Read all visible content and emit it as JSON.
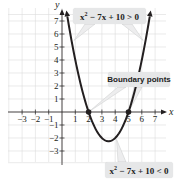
{
  "chart_data": {
    "type": "line",
    "title": "",
    "function": "x^2 - 7x + 10",
    "xlabel": "x",
    "ylabel": "y",
    "xlim": [
      -3.9,
      7.6
    ],
    "ylim": [
      -3.9,
      8
    ],
    "x_ticks": [
      -3,
      -2,
      -1,
      1,
      2,
      3,
      4,
      5,
      6,
      7
    ],
    "y_ticks": [
      7,
      6,
      5,
      4,
      3,
      2,
      1,
      -1,
      -2,
      -3
    ],
    "x_tick_labels": [
      "−3",
      "−2",
      "−1",
      "1",
      "2",
      "3",
      "4",
      "5",
      "6",
      "7"
    ],
    "y_tick_labels": [
      "7",
      "6",
      "5",
      "4",
      "3",
      "2",
      "1",
      "−1",
      "−2",
      "−3"
    ],
    "grid": true,
    "series": [
      {
        "name": "y = x^2 - 7x + 10",
        "x": [
          0.35,
          1,
          1.5,
          2,
          2.5,
          3,
          3.5,
          4,
          4.5,
          5,
          5.5,
          6,
          6.65
        ],
        "values": [
          7.67,
          4,
          1.75,
          0,
          -1.25,
          -2,
          -2.25,
          -2,
          -1.25,
          0,
          1.75,
          4,
          7.67
        ]
      }
    ],
    "boundary_points": [
      [
        2,
        0
      ],
      [
        5,
        0
      ]
    ],
    "vertex": [
      3.5,
      -2.25
    ],
    "annotations": [
      {
        "text": "x² − 7x + 10 > 0",
        "points_to": "both upper branches"
      },
      {
        "text": "Boundary points",
        "points_to": [
          [
            2,
            0
          ],
          [
            5,
            0
          ]
        ]
      },
      {
        "text": "x² − 7x + 10 < 0",
        "points_to": "curve below x-axis"
      }
    ]
  },
  "labels": {
    "axis_x": "x",
    "axis_y": "y",
    "greater": {
      "pre": "x",
      "sup": "2",
      "post": " − 7x + 10 > 0"
    },
    "boundary": "Boundary points",
    "less": {
      "pre": "x",
      "sup": "2",
      "post": " − 7x + 10 < 0"
    }
  },
  "colors": {
    "curve": "#231f20",
    "grid": "#dcdcdc",
    "axis": "#231f20",
    "label_bg": "#e6e7e8"
  }
}
